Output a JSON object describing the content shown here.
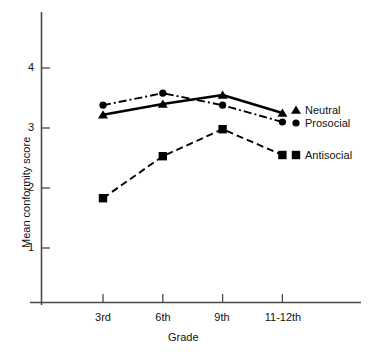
{
  "chart_data": {
    "type": "line",
    "title": "",
    "xlabel": "Grade",
    "ylabel": "Mean conformity score",
    "categories": [
      "3rd",
      "6th",
      "9th",
      "11-12th"
    ],
    "ylim": [
      0,
      4.6
    ],
    "yticks": [
      1,
      2,
      3,
      4
    ],
    "ytick_labels": [
      "1",
      "2",
      "3",
      "4"
    ],
    "grid": false,
    "legend_position": "right-inline",
    "series": [
      {
        "name": "Neutral",
        "values": [
          3.22,
          3.4,
          3.55,
          3.25
        ],
        "marker": "triangle",
        "line_style": "solid",
        "color": "#000000"
      },
      {
        "name": "Prosocial",
        "values": [
          3.38,
          3.58,
          3.38,
          3.1
        ],
        "marker": "circle",
        "line_style": "dash-dot",
        "color": "#000000"
      },
      {
        "name": "Antisocial",
        "values": [
          1.83,
          2.53,
          2.98,
          2.55
        ],
        "marker": "square",
        "line_style": "dashed",
        "color": "#000000"
      }
    ]
  },
  "axes": {
    "y_tick_values": [
      "1",
      "2",
      "3",
      "4"
    ],
    "x_tick_values": [
      "3rd",
      "6th",
      "9th",
      "11-12th"
    ]
  },
  "legend": {
    "entries": [
      {
        "label": "Neutral"
      },
      {
        "label": "Prosocial"
      },
      {
        "label": "Antisocial"
      }
    ]
  }
}
